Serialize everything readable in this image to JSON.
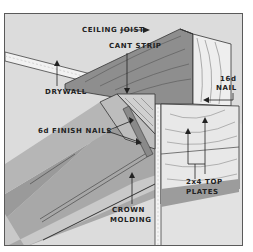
{
  "diagram": {
    "type": "crown molding installation cross-section",
    "labels": {
      "ceiling_joist": "CEILING JOIST",
      "cant_strip": "CANT STRIP",
      "drywall": "DRYWALL",
      "nail_16d_line1": "16d",
      "nail_16d_line2": "NAIL",
      "finish_nails": "6d FINISH NAILS",
      "top_plates_line1": "2x4 TOP",
      "top_plates_line2": "PLATES",
      "crown_molding_line1": "CROWN",
      "crown_molding_line2": "MOLDING"
    },
    "colors": {
      "background": "#dcdcdc",
      "ceiling": "#d9d9d9",
      "wall": "#e4e4e4",
      "molding": "#a9a9a9",
      "molding_dark": "#8f8f8f",
      "joist_face": "#8c8c8c",
      "joist_end": "#eeeeee",
      "plates": "#e8e8e8",
      "drywall_edge": "#f2f2f2",
      "outline": "#333333",
      "text": "#222222"
    }
  }
}
